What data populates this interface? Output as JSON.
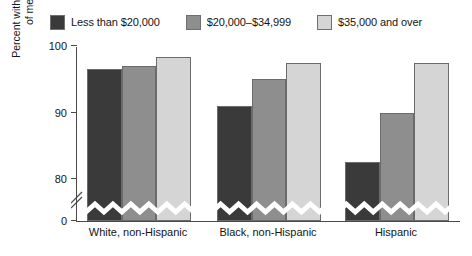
{
  "chart_data": {
    "type": "bar",
    "title": "",
    "subtitle": "",
    "xlabel": "",
    "ylabel": "Percent with a regular source of medical care",
    "ylim": [
      0,
      100
    ],
    "y_axis_break": true,
    "y_ticks": [
      {
        "value": 100,
        "label": "100"
      },
      {
        "value": 90,
        "label": "90"
      },
      {
        "value": 80,
        "label": "80"
      },
      {
        "value": 0,
        "label": "0"
      }
    ],
    "grid": false,
    "legend_position": "top-center",
    "categories": [
      "White, non-Hispanic",
      "Black, non-Hispanic",
      "Hispanic"
    ],
    "series": [
      {
        "name": "Less than $20,000",
        "color": "#3a3a3a",
        "values": [
          96.5,
          91.0,
          82.5
        ]
      },
      {
        "name": "$20,000–$34,999",
        "color": "#8e8e8e",
        "values": [
          97.0,
          95.0,
          90.0
        ]
      },
      {
        "name": "$35,000 and over",
        "color": "#d5d5d5",
        "values": [
          98.3,
          97.5,
          97.5
        ]
      }
    ]
  },
  "legend": {
    "items": [
      {
        "label": "Less than $20,000",
        "color": "#3a3a3a"
      },
      {
        "label": "$20,000–$34,999",
        "color": "#8e8e8e"
      },
      {
        "label": "$35,000 and over",
        "color": "#d5d5d5"
      }
    ]
  },
  "axes": {
    "y_title_line1": "Percent with a regular source",
    "y_title_line2": "of medical care",
    "y_tick_labels": [
      "100",
      "90",
      "80",
      "0"
    ],
    "x_tick_labels": [
      "White, non-Hispanic",
      "Black, non-Hispanic",
      "Hispanic"
    ]
  },
  "colors": {
    "axis": "#4a4a4a",
    "text": "#141414",
    "background": "#ffffff",
    "bar_outline": "#6b6b6b"
  }
}
